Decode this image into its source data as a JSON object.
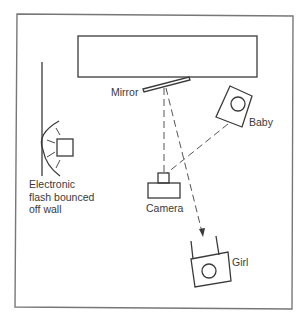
{
  "diagram": {
    "type": "photographic lighting setup (top view)",
    "labels": {
      "mirror": "Mirror",
      "baby": "Baby",
      "camera": "Camera",
      "girl": "Girl",
      "flash_line1": "Electronic",
      "flash_line2": "flash bounced",
      "flash_line3": "off wall"
    },
    "elements": [
      {
        "id": "wall-top-rectangle",
        "kind": "rectangle"
      },
      {
        "id": "mirror",
        "kind": "angled bar",
        "label": "Mirror"
      },
      {
        "id": "baby",
        "kind": "rotated box with circle",
        "label": "Baby"
      },
      {
        "id": "camera",
        "kind": "camera shape",
        "label": "Camera"
      },
      {
        "id": "girl",
        "kind": "rotated box with circle",
        "label": "Girl"
      },
      {
        "id": "flash",
        "kind": "box with bounce arc",
        "label": "Electronic flash bounced off wall"
      }
    ],
    "paths": [
      {
        "from": "camera",
        "to": "mirror",
        "style": "dashed"
      },
      {
        "from": "mirror",
        "to": "girl",
        "style": "dashed with arrow"
      },
      {
        "from": "baby",
        "to": "camera",
        "style": "dashed"
      }
    ],
    "colors": {
      "line": "#3a3a3a",
      "frame": "#777777",
      "background": "#ffffff"
    }
  }
}
